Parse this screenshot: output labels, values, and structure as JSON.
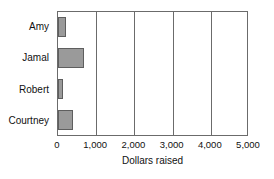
{
  "chart_data": {
    "type": "bar",
    "orientation": "horizontal",
    "title": "",
    "xlabel": "Dollars raised",
    "ylabel": "",
    "categories": [
      "Amy",
      "Jamal",
      "Robert",
      "Courtney"
    ],
    "values": [
      210,
      680,
      130,
      390
    ],
    "xlim": [
      0,
      5000
    ],
    "xticks": [
      0,
      1000,
      2000,
      3000,
      4000,
      5000
    ],
    "xtick_labels": [
      "0",
      "1,000",
      "2,000",
      "3,000",
      "4,000",
      "5,000"
    ],
    "grid": "vertical",
    "legend": "none",
    "series": [
      {
        "name": "Dollars raised",
        "values": [
          210,
          680,
          130,
          390
        ]
      }
    ],
    "colors": {
      "bar_fill": "#9a9a9a",
      "bar_stroke": "#5e5e5e",
      "axis": "#6b6b6b",
      "text": "#111111",
      "background": "#ffffff"
    }
  }
}
